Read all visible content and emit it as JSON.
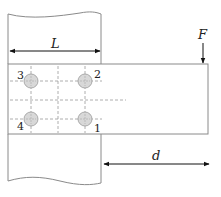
{
  "diagram": {
    "labels": {
      "length": "L",
      "force": "F",
      "eccentricity": "d"
    },
    "bolts": [
      {
        "id": "1",
        "label": "1"
      },
      {
        "id": "2",
        "label": "2"
      },
      {
        "id": "3",
        "label": "3"
      },
      {
        "id": "4",
        "label": "4"
      }
    ],
    "colors": {
      "outline": "#8a8a8a",
      "bolt_fill": "#d8d8d8",
      "bolt_stroke": "#9a9a9a",
      "dashed": "#9a9a9a",
      "arrow": "#111111"
    }
  }
}
